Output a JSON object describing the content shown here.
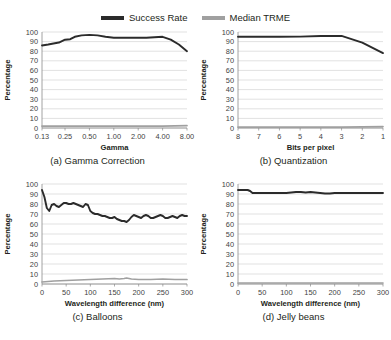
{
  "legend": {
    "position": "top-center",
    "items": [
      {
        "label": "Success Rate",
        "color": "#2b2b2b",
        "icon": "line-swatch"
      },
      {
        "label": "Median TRME",
        "color": "#a0a0a0",
        "icon": "line-swatch"
      }
    ]
  },
  "captions": {
    "a": "(a) Gamma Correction",
    "b": "(b) Quantization",
    "c": "(c) Balloons",
    "d": "(d) Jelly beans"
  },
  "axis_labels": {
    "y": "Percentage",
    "gamma": "Gamma",
    "bpp": "Bits per pixel",
    "wavelength": "Wavelength difference (nm)"
  },
  "y_ticks": [
    "0",
    "10",
    "20",
    "30",
    "40",
    "50",
    "60",
    "70",
    "80",
    "90",
    "100"
  ],
  "chart_data": [
    {
      "id": "a",
      "type": "line",
      "title": "(a) Gamma Correction",
      "xlabel": "Gamma",
      "ylabel": "Percentage",
      "xscale": "log2",
      "categories": [
        "0.13",
        "0.25",
        "0.50",
        "1.00",
        "2.00",
        "4.00",
        "8.00"
      ],
      "x": [
        0.13,
        0.25,
        0.5,
        1.0,
        2.0,
        4.0,
        8.0
      ],
      "ylim": [
        0,
        100
      ],
      "xlim": [
        0.13,
        8.0
      ],
      "grid": true,
      "legend": "top",
      "series": [
        {
          "name": "Success Rate",
          "color": "#2b2b2b",
          "x": [
            0.13,
            0.155,
            0.18,
            0.21,
            0.25,
            0.29,
            0.33,
            0.4,
            0.5,
            0.63,
            0.79,
            1.0,
            1.26,
            1.59,
            2.0,
            2.52,
            3.17,
            4.0,
            5.04,
            6.35,
            8.0
          ],
          "values": [
            86,
            87,
            88,
            89,
            92,
            92.5,
            95,
            96.5,
            97,
            96.5,
            95,
            94,
            94,
            94,
            94,
            94,
            94.5,
            95,
            92,
            87,
            80
          ]
        },
        {
          "name": "Median TRME",
          "color": "#a0a0a0",
          "x": [
            0.13,
            0.25,
            0.5,
            1.0,
            2.0,
            4.0,
            8.0
          ],
          "values": [
            2,
            2,
            2,
            2,
            2,
            2,
            2.5
          ]
        }
      ]
    },
    {
      "id": "b",
      "type": "line",
      "title": "(b) Quantization",
      "xlabel": "Bits per pixel",
      "ylabel": "Percentage",
      "xscale": "linear-reversed",
      "categories": [
        "8",
        "7",
        "6",
        "5",
        "4",
        "3",
        "2",
        "1"
      ],
      "x": [
        8,
        7,
        6,
        5,
        4,
        3,
        2,
        1
      ],
      "ylim": [
        0,
        100
      ],
      "grid": true,
      "series": [
        {
          "name": "Success Rate",
          "color": "#2b2b2b",
          "values": [
            95,
            95,
            95,
            95.2,
            95.8,
            96,
            89,
            78
          ]
        },
        {
          "name": "Median TRME",
          "color": "#a0a0a0",
          "values": [
            1,
            1,
            1,
            1,
            1,
            1,
            1.2,
            1.5
          ]
        }
      ]
    },
    {
      "id": "c",
      "type": "line",
      "title": "(c) Balloons",
      "xlabel": "Wavelength difference (nm)",
      "ylabel": "Percentage",
      "xscale": "linear",
      "categories": [
        "0",
        "50",
        "100",
        "150",
        "200",
        "250",
        "300"
      ],
      "ylim": [
        0,
        100
      ],
      "xlim": [
        0,
        300
      ],
      "grid": true,
      "series": [
        {
          "name": "Success Rate",
          "color": "#2b2b2b",
          "x": [
            0,
            5,
            10,
            15,
            20,
            25,
            30,
            35,
            40,
            45,
            50,
            55,
            60,
            65,
            70,
            75,
            80,
            85,
            90,
            95,
            100,
            105,
            110,
            115,
            120,
            125,
            130,
            135,
            140,
            145,
            150,
            155,
            160,
            165,
            170,
            175,
            180,
            185,
            190,
            195,
            200,
            205,
            210,
            215,
            220,
            225,
            230,
            235,
            240,
            245,
            250,
            255,
            260,
            265,
            270,
            275,
            280,
            285,
            290,
            295,
            300
          ],
          "values": [
            94,
            87,
            76,
            73,
            79,
            80,
            78,
            77,
            79,
            81,
            81,
            80,
            80,
            81,
            80,
            79,
            78,
            77,
            80,
            79,
            73,
            71,
            70,
            70,
            69,
            68,
            68,
            67,
            66,
            66,
            67,
            65,
            64,
            63,
            63,
            62,
            64,
            67,
            69,
            68,
            67,
            66,
            68,
            69,
            68,
            66,
            66,
            67,
            68,
            69,
            68,
            66,
            66,
            67,
            68,
            67,
            66,
            68,
            69,
            68,
            68
          ]
        },
        {
          "name": "Median TRME",
          "color": "#a0a0a0",
          "x": [
            0,
            25,
            50,
            75,
            100,
            125,
            150,
            160,
            170,
            175,
            185,
            200,
            225,
            250,
            275,
            300
          ],
          "values": [
            2,
            3,
            3.5,
            4,
            4.5,
            5,
            5.5,
            5,
            5.5,
            6,
            5,
            4.5,
            4.5,
            5,
            4.5,
            4.5
          ]
        }
      ]
    },
    {
      "id": "d",
      "type": "line",
      "title": "(d) Jelly beans",
      "xlabel": "Wavelength difference (nm)",
      "ylabel": "Percentage",
      "xscale": "linear",
      "categories": [
        "0",
        "50",
        "100",
        "150",
        "200",
        "250",
        "300"
      ],
      "ylim": [
        0,
        100
      ],
      "xlim": [
        0,
        300
      ],
      "grid": true,
      "series": [
        {
          "name": "Success Rate",
          "color": "#2b2b2b",
          "x": [
            0,
            10,
            20,
            25,
            30,
            40,
            60,
            80,
            100,
            110,
            120,
            130,
            140,
            150,
            160,
            170,
            180,
            190,
            200,
            220,
            240,
            260,
            280,
            300
          ],
          "values": [
            94,
            94,
            94,
            93,
            91,
            91,
            91,
            91,
            91,
            91.5,
            92,
            92,
            91.5,
            92,
            91.5,
            91,
            90.5,
            90.5,
            91,
            91,
            91,
            91,
            91,
            91
          ]
        },
        {
          "name": "Median TRME",
          "color": "#a0a0a0",
          "x": [
            0,
            50,
            100,
            150,
            200,
            250,
            300
          ],
          "values": [
            1,
            1,
            1,
            1,
            1,
            1,
            1
          ]
        }
      ]
    }
  ]
}
